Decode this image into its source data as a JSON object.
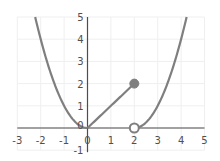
{
  "chart_data": {
    "type": "line",
    "title": "",
    "xlabel": "",
    "ylabel": "",
    "xlim": [
      -3,
      5
    ],
    "ylim": [
      -1,
      5
    ],
    "grid": true,
    "legend": null,
    "x_ticks": [
      "-3",
      "-2",
      "-1",
      "0",
      "1",
      "2",
      "3",
      "4",
      "5"
    ],
    "y_ticks": [
      "-1",
      "0",
      "1",
      "2",
      "3",
      "4",
      "5"
    ],
    "series": [
      {
        "name": "left-parabola",
        "function": "y = x^2",
        "domain": [
          -2.236,
          0
        ],
        "x": [
          -2.236,
          -2,
          -1.5,
          -1,
          -0.5,
          0
        ],
        "y": [
          5,
          4,
          2.25,
          1,
          0.25,
          0
        ]
      },
      {
        "name": "middle-line",
        "function": "y = x",
        "domain": [
          0,
          2
        ],
        "x": [
          0,
          2
        ],
        "y": [
          0,
          2
        ]
      },
      {
        "name": "right-parabola",
        "function": "y = (x-2)^2",
        "domain": [
          2,
          4.236
        ],
        "x": [
          2,
          2.5,
          3,
          3.5,
          4,
          4.236
        ],
        "y": [
          0,
          0.25,
          1,
          2.25,
          4,
          5
        ]
      }
    ],
    "markers": [
      {
        "type": "closed",
        "x": 2,
        "y": 2
      },
      {
        "type": "open",
        "x": 2,
        "y": 0
      }
    ],
    "colors": {
      "curve": "#7f7f7f",
      "axis": "#4d4d4d",
      "grid": "#efefef",
      "marker_fill": "#7f7f7f"
    }
  }
}
